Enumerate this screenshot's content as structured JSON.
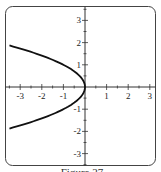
{
  "chart_data": {
    "type": "line",
    "title": "",
    "caption": "Figure 27",
    "xlabel": "",
    "ylabel": "",
    "xlim": [
      -3.5,
      3.5
    ],
    "ylim": [
      -3.5,
      3.5
    ],
    "grid": false,
    "x_ticks": [
      -3,
      -2,
      -1,
      1,
      2,
      3
    ],
    "y_ticks": [
      -3,
      -2,
      -1,
      1,
      2,
      3
    ],
    "x_tick_labels": [
      "-3",
      "-2",
      "-1",
      "1",
      "2",
      "3"
    ],
    "y_tick_labels": [
      "3",
      "2",
      "1",
      "-1",
      "-2",
      "-3"
    ],
    "series": [
      {
        "name": "x = -y^2",
        "points": [
          [
            -3.5,
            1.87
          ],
          [
            -2.25,
            1.5
          ],
          [
            -1,
            1
          ],
          [
            -0.25,
            0.5
          ],
          [
            0,
            0
          ],
          [
            -0.25,
            -0.5
          ],
          [
            -1,
            -1
          ],
          [
            -2.25,
            -1.5
          ],
          [
            -3.5,
            -1.87
          ]
        ]
      }
    ]
  }
}
